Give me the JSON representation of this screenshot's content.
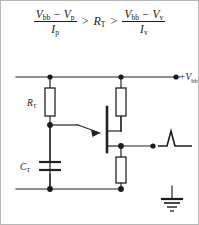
{
  "figure": {
    "equation": {
      "left_fraction": {
        "numerator_v1": "V",
        "numerator_v1_sub": "bb",
        "numerator_minus": "−",
        "numerator_v2": "V",
        "numerator_v2_sub": "p",
        "denominator": "I",
        "denominator_sub": "p"
      },
      "relation_1": ">",
      "middle_term": "R",
      "middle_term_sub": "T",
      "relation_2": ">",
      "right_fraction": {
        "numerator_v1": "V",
        "numerator_v1_sub": "bb",
        "numerator_minus": "−",
        "numerator_v2": "V",
        "numerator_v2_sub": "v",
        "denominator": "I",
        "denominator_sub": "v"
      }
    },
    "circuit": {
      "supply_label": "+V",
      "supply_label_sub": "bb",
      "timing_resistor_label": "R",
      "timing_resistor_label_sub": "T",
      "timing_capacitor_label": "C",
      "timing_capacitor_label_sub": "T",
      "components": [
        "timing-resistor-rt",
        "timing-capacitor-ct",
        "base2-resistor",
        "base1-resistor",
        "unijunction-transistor",
        "ground-symbol",
        "output-pulse-waveform"
      ]
    },
    "colors": {
      "ink": "#1b1b1b",
      "wire": "#222222",
      "background": "#ffffff",
      "border": "#b8b8b8"
    }
  }
}
